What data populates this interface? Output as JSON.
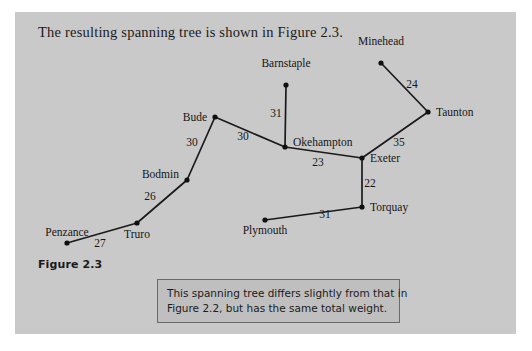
{
  "page": {
    "background": "#ffffff",
    "panel_color": "#c9c9c9"
  },
  "intro": {
    "text": "The resulting spanning tree is shown in Figure 2.3."
  },
  "figure": {
    "label": "Figure 2.3"
  },
  "caption": {
    "line1": "This spanning tree differs slightly from that in",
    "line2": "Figure 2.2, but has the same total weight.",
    "background": "#bfbfbf",
    "border": "#6a6a6a"
  },
  "chart_data": {
    "type": "diagram",
    "title": "Figure 2.3",
    "nodes": [
      {
        "id": "minehead",
        "label": "Minehead",
        "x": 381,
        "y": 63,
        "label_x": 381,
        "label_y": 53,
        "label_anchor": "middle",
        "label_dy": -8
      },
      {
        "id": "taunton",
        "label": "Taunton",
        "x": 428,
        "y": 112,
        "label_x": 436,
        "label_y": 116,
        "label_anchor": "start",
        "label_dy": 0
      },
      {
        "id": "barnstaple",
        "label": "Barnstaple",
        "x": 286,
        "y": 85,
        "label_x": 286,
        "label_y": 75,
        "label_anchor": "middle",
        "label_dy": -8
      },
      {
        "id": "bude",
        "label": "Bude",
        "x": 215,
        "y": 117,
        "label_x": 207,
        "label_y": 121,
        "label_anchor": "end",
        "label_dy": 0
      },
      {
        "id": "okehampton",
        "label": "Okehampton",
        "x": 285,
        "y": 147,
        "label_x": 293,
        "label_y": 146,
        "label_anchor": "start",
        "label_dy": 0
      },
      {
        "id": "exeter",
        "label": "Exeter",
        "x": 362,
        "y": 158,
        "label_x": 370,
        "label_y": 162,
        "label_anchor": "start",
        "label_dy": 0
      },
      {
        "id": "torquay",
        "label": "Torquay",
        "x": 362,
        "y": 207,
        "label_x": 370,
        "label_y": 211,
        "label_anchor": "start",
        "label_dy": 0
      },
      {
        "id": "plymouth",
        "label": "Plymouth",
        "x": 265,
        "y": 220,
        "label_x": 265,
        "label_y": 234,
        "label_anchor": "middle",
        "label_dy": 0
      },
      {
        "id": "bodmin",
        "label": "Bodmin",
        "x": 187,
        "y": 180,
        "label_x": 179,
        "label_y": 178,
        "label_anchor": "end",
        "label_dy": 0
      },
      {
        "id": "truro",
        "label": "Truro",
        "x": 137,
        "y": 223,
        "label_x": 137,
        "label_y": 238,
        "label_anchor": "middle",
        "label_dy": 0
      },
      {
        "id": "penzance",
        "label": "Penzance",
        "x": 67,
        "y": 243,
        "label_x": 67,
        "label_y": 236,
        "label_anchor": "middle",
        "label_dy": 0
      }
    ],
    "edges": [
      {
        "from": "minehead",
        "to": "taunton",
        "weight": "24",
        "wx": 412,
        "wy": 88
      },
      {
        "from": "taunton",
        "to": "exeter",
        "weight": "35",
        "wx": 399,
        "wy": 146
      },
      {
        "from": "barnstaple",
        "to": "okehampton",
        "weight": "31",
        "wx": 276,
        "wy": 117
      },
      {
        "from": "bude",
        "to": "okehampton",
        "weight": "30",
        "wx": 243,
        "wy": 140
      },
      {
        "from": "bude",
        "to": "bodmin",
        "weight": "30",
        "wx": 192,
        "wy": 146
      },
      {
        "from": "okehampton",
        "to": "exeter",
        "weight": "23",
        "wx": 318,
        "wy": 166
      },
      {
        "from": "exeter",
        "to": "torquay",
        "weight": "22",
        "wx": 370,
        "wy": 187
      },
      {
        "from": "plymouth",
        "to": "torquay",
        "weight": "31",
        "wx": 325,
        "wy": 218
      },
      {
        "from": "bodmin",
        "to": "truro",
        "weight": "26",
        "wx": 150,
        "wy": 200
      },
      {
        "from": "truro",
        "to": "penzance",
        "weight": "27",
        "wx": 100,
        "wy": 247
      }
    ],
    "total_weight": 279
  }
}
